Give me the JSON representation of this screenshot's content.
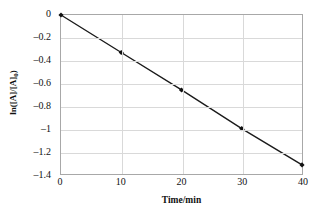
{
  "chart_data": {
    "type": "line",
    "title": "",
    "xlabel": "Time/min",
    "ylabel": "ln([A]/[A]₀)",
    "ylabel_main": "ln([A]/[A]",
    "ylabel_sub": "0",
    "ylabel_tail": ")",
    "x": [
      0,
      10,
      20,
      30,
      40
    ],
    "values": [
      0,
      -0.33,
      -0.66,
      -1.0,
      -1.32
    ],
    "series": [
      {
        "name": "ln([A]/[A]₀) vs time",
        "x": [
          0,
          10,
          20,
          30,
          40
        ],
        "values": [
          0,
          -0.33,
          -0.66,
          -1.0,
          -1.32
        ]
      }
    ],
    "xlim": [
      0,
      40
    ],
    "ylim": [
      -1.4,
      0
    ],
    "xticks": [
      0,
      10,
      20,
      30,
      40
    ],
    "yticks": [
      0,
      -0.2,
      -0.4,
      -0.6,
      -0.8,
      -1,
      -1.2,
      -1.4
    ],
    "xtick_labels": [
      "0",
      "10",
      "20",
      "30",
      "40"
    ],
    "ytick_labels": [
      "0",
      "–0.2",
      "–0.4",
      "–0.6",
      "–0.8",
      "–1",
      "–1.2",
      "–1.4"
    ],
    "grid": true,
    "grid_axes": "both",
    "legend": false,
    "legend_position": "none",
    "marker": "filled-diamond",
    "line_color": "#1a1a1a",
    "marker_color": "#111111",
    "grid_color": "#d9d9d9",
    "frame_color": "#a8a8a8",
    "background_color": "#ffffff",
    "annotations": []
  }
}
